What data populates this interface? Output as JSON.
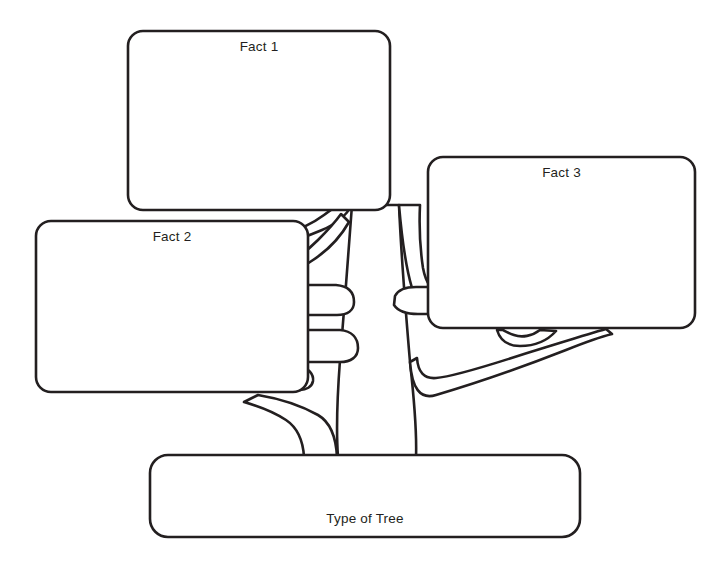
{
  "diagram": {
    "type": "tree-graphic-organizer",
    "title_text": "Type of Tree",
    "background_color": "#ffffff",
    "stroke_color": "#231f20",
    "stroke_width": 2.5,
    "canvas": {
      "width": 723,
      "height": 564
    },
    "boxes": [
      {
        "id": "fact1",
        "label": "Fact 1",
        "x": 128,
        "y": 31,
        "width": 262,
        "height": 179,
        "radius": 15,
        "label_align": "top-center"
      },
      {
        "id": "fact2",
        "label": "Fact 2",
        "x": 36,
        "y": 221,
        "width": 272,
        "height": 171,
        "radius": 15,
        "label_align": "top-center"
      },
      {
        "id": "fact3",
        "label": "Fact 3",
        "x": 428,
        "y": 157,
        "width": 267,
        "height": 171,
        "radius": 15,
        "label_align": "top-center"
      },
      {
        "id": "type-of-tree",
        "label": "Type of Tree",
        "x": 150,
        "y": 455,
        "width": 430,
        "height": 82,
        "radius": 18,
        "label_align": "bottom-center"
      }
    ],
    "trunk": {
      "name": "tree-trunk",
      "top_y": 205,
      "bottom_y": 457,
      "left_x": 338,
      "right_x": 416
    },
    "branch_count": 8
  }
}
